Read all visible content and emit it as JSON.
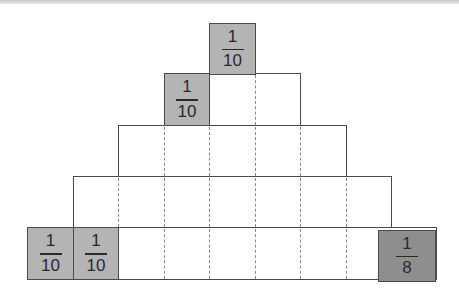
{
  "diagram": {
    "type": "fraction-pyramid",
    "column_width_px": 45.5,
    "rows": [
      {
        "index": 0,
        "span_columns": 1,
        "shaded_cells": [
          {
            "numerator": "1",
            "denominator": "10"
          }
        ]
      },
      {
        "index": 1,
        "span_columns": 3,
        "shaded_cells": [
          {
            "numerator": "1",
            "denominator": "10"
          }
        ]
      },
      {
        "index": 2,
        "span_columns": 5,
        "shaded_cells": []
      },
      {
        "index": 3,
        "span_columns": 7,
        "shaded_cells": []
      },
      {
        "index": 4,
        "span_columns": 9,
        "shaded_cells": [
          {
            "numerator": "1",
            "denominator": "10"
          },
          {
            "numerator": "1",
            "denominator": "10"
          },
          {
            "numerator": "1",
            "denominator": "8"
          }
        ]
      }
    ],
    "colors": {
      "shaded": "#b4b4b4",
      "shaded_dark": "#8e8e8e",
      "border": "#4a4a4a",
      "dashed": "#8a8a8a"
    }
  },
  "cells": {
    "top": {
      "num": "1",
      "den": "10"
    },
    "row1_left": {
      "num": "1",
      "den": "10"
    },
    "bottom_1": {
      "num": "1",
      "den": "10"
    },
    "bottom_2": {
      "num": "1",
      "den": "10"
    },
    "bottom_right": {
      "num": "1",
      "den": "8"
    }
  }
}
